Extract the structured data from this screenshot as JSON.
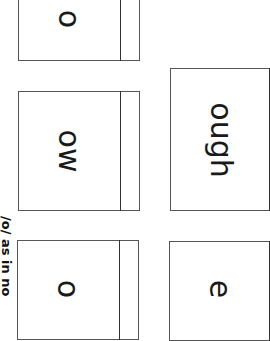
{
  "worksheet": {
    "heading": "/o/ as in no",
    "orientation": "rotated 90° clockwise",
    "cards": [
      {
        "label": "o"
      },
      {
        "label": "ow"
      },
      {
        "label": "o"
      },
      {
        "label": "ough"
      },
      {
        "label": "e"
      }
    ]
  },
  "colors": {
    "border": "#555555",
    "text": "#1a1a1a",
    "background": "#ffffff"
  }
}
